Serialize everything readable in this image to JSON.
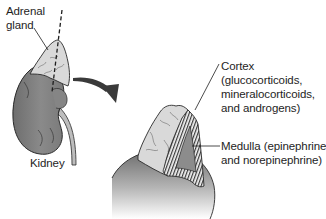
{
  "figure": {
    "labels": {
      "adrenal_gland": {
        "line1": "Adrenal",
        "line2": "gland"
      },
      "kidney": "Kidney",
      "cortex": {
        "line1": "Cortex",
        "line2": "(glucocorticoids,",
        "line3": "mineralocorticoids,",
        "line4": "and androgens)"
      },
      "medulla": {
        "line1": "Medulla (epinephrine",
        "line2": "and norepinephrine)"
      }
    },
    "colors": {
      "kidney_fill": "#7d7d7d",
      "gland_fill": "#d9d9d9",
      "medulla_fill": "#8c8c8c",
      "arrow_fill": "#3a3a3a",
      "outline": "#2a2a2a",
      "text": "#1e1e1e"
    }
  }
}
